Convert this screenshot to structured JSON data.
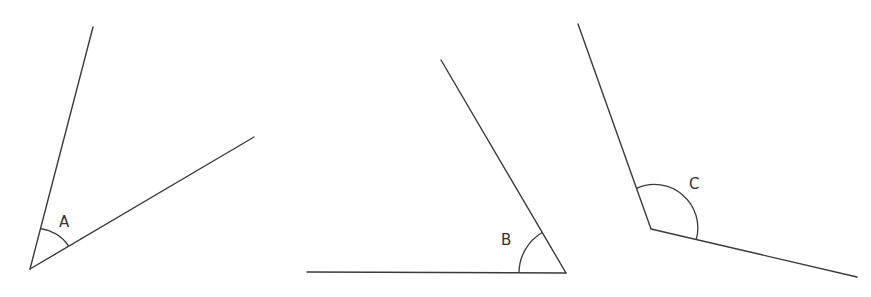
{
  "diagram": {
    "title": "",
    "stroke_color": "#3a3a3a",
    "angles": [
      {
        "label": "A",
        "type": "acute",
        "vertex": [
          30,
          269
        ],
        "ray1_end": [
          93,
          27
        ],
        "ray2_end": [
          254,
          137
        ],
        "label_pos": [
          59,
          214
        ]
      },
      {
        "label": "B",
        "type": "acute",
        "vertex": [
          566,
          273
        ],
        "ray1_end": [
          441,
          60
        ],
        "ray2_end": [
          307,
          272
        ],
        "label_pos": [
          501,
          232
        ]
      },
      {
        "label": "C",
        "type": "obtuse",
        "vertex": [
          651,
          229
        ],
        "ray1_end": [
          578,
          24
        ],
        "ray2_end": [
          857,
          277
        ],
        "label_pos": [
          690,
          176
        ]
      }
    ]
  }
}
